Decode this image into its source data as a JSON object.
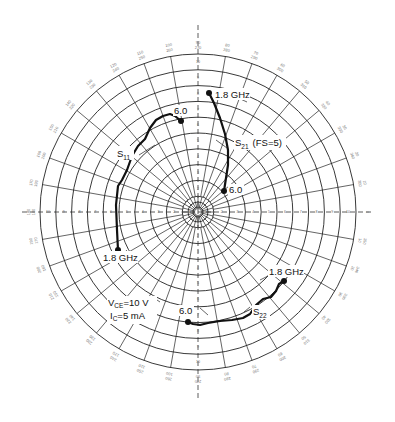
{
  "chart_data": {
    "type": "polar",
    "title": "",
    "radial_rings": 10,
    "angular_step_deg": 10,
    "angle_labels": [
      "0",
      "10",
      "20",
      "30",
      "40",
      "50",
      "60",
      "70",
      "80",
      "90",
      "100",
      "110",
      "120",
      "130",
      "140",
      "150",
      "160",
      "170",
      "180",
      "190",
      "200",
      "210",
      "220",
      "230",
      "240",
      "250",
      "260",
      "270",
      "280",
      "290",
      "300",
      "310",
      "320",
      "330",
      "340",
      "350"
    ],
    "series": [
      {
        "name": "S11",
        "label": "S",
        "label_sub": "11",
        "start_label": "1.8 GHz",
        "end_label": "6.0",
        "points_px": [
          [
            118,
            250
          ],
          [
            117,
            230
          ],
          [
            116,
            205
          ],
          [
            118,
            186
          ],
          [
            122,
            180
          ],
          [
            127,
            170
          ],
          [
            132,
            156
          ],
          [
            138,
            146
          ],
          [
            145,
            139
          ],
          [
            150,
            128
          ],
          [
            156,
            120
          ],
          [
            163,
            116
          ],
          [
            170,
            114
          ],
          [
            175,
            116
          ],
          [
            181,
            121
          ]
        ]
      },
      {
        "name": "S21",
        "label": "S",
        "label_sub": "21",
        "label_extra": "(FS=5)",
        "start_label": "1.8 GHz",
        "end_label": "6.0",
        "points_px": [
          [
            209,
            93
          ],
          [
            214,
            103
          ],
          [
            220,
            118
          ],
          [
            225,
            134
          ],
          [
            228,
            150
          ],
          [
            228,
            165
          ],
          [
            226,
            178
          ],
          [
            224,
            191
          ]
        ]
      },
      {
        "name": "S22",
        "label": "S",
        "label_sub": "22",
        "start_label": "1.8 GHz",
        "end_label": "6.0",
        "points_px": [
          [
            284,
            281
          ],
          [
            279,
            284
          ],
          [
            276,
            291
          ],
          [
            271,
            297
          ],
          [
            263,
            299
          ],
          [
            256,
            305
          ],
          [
            250,
            314
          ],
          [
            243,
            318
          ],
          [
            232,
            320
          ],
          [
            220,
            321
          ],
          [
            208,
            323
          ],
          [
            200,
            325
          ],
          [
            193,
            324
          ],
          [
            188,
            322
          ]
        ]
      }
    ],
    "annotations": {
      "bias_line1_main": "V",
      "bias_line1_sub": "CE",
      "bias_line1_rest": "=10 V",
      "bias_line2_main": "I",
      "bias_line2_sub": "C",
      "bias_line2_rest": "=5 mA"
    },
    "colors": {
      "grid": "#222222",
      "trace": "#111111",
      "background": "#ffffff"
    }
  },
  "labels": {
    "s11_start": "1.8 GHz",
    "s11_end": "6.0",
    "s11_name": "S",
    "s11_sub": "11",
    "s21_start": "1.8 GHz",
    "s21_end": "6.0",
    "s21_name": "S",
    "s21_sub": "21",
    "s21_extra": "(FS=5)",
    "s22_start": "1.8 GHz",
    "s22_end": "6.0",
    "s22_name": "S",
    "s22_sub": "22",
    "vce_main": "V",
    "vce_sub": "CE",
    "vce_rest": "=10 V",
    "ic_main": "I",
    "ic_sub": "C",
    "ic_rest": "=5 mA"
  }
}
